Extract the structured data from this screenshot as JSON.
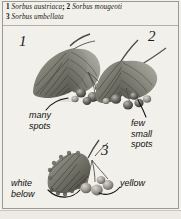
{
  "page": {
    "background": "#f2f0ea",
    "border_color": "#9a9a95",
    "width": 181,
    "height": 219
  },
  "header": {
    "line1": {
      "num1": "1",
      "species1": "Sorbus austriaca",
      "separator": ";",
      "num2": "2",
      "species2": "Sorbus mougeoti"
    },
    "line2": {
      "num3": "3",
      "species3": "Sorbus umbellata"
    }
  },
  "figures": [
    {
      "numeral": "1",
      "species": "Sorbus austriaca",
      "position": "upper-left",
      "subject": "leaf-and-berry-cluster"
    },
    {
      "numeral": "2",
      "species": "Sorbus mougeoti",
      "position": "upper-right",
      "subject": "leaf-and-berry-cluster"
    },
    {
      "numeral": "3",
      "species": "Sorbus umbellata",
      "position": "bottom-center",
      "subject": "leaf-and-berry-cluster"
    }
  ],
  "annotations": [
    {
      "id": "many-spots",
      "line1": "many",
      "line2": "spots",
      "target": "figure-1"
    },
    {
      "id": "few-small-spots",
      "line1": "few",
      "line2": "small",
      "line3": "spots",
      "target": "figure-2"
    },
    {
      "id": "white-below",
      "line1": "white",
      "line2": "below",
      "target": "figure-3-leaf"
    },
    {
      "id": "yellow",
      "line1": "yellow",
      "target": "figure-3-berries"
    }
  ],
  "colors": {
    "ink": "#15150f",
    "annotation_ink": "#101010",
    "rule": "#b4b2aa",
    "artwork_dark": "#3a3a34",
    "artwork_mid": "#8c8c84",
    "artwork_light": "#c9c7bd"
  }
}
